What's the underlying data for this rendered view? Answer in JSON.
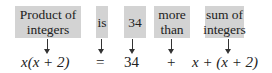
{
  "phrases": [
    {
      "line1": "Product of",
      "line2": "integers"
    },
    {
      "line1": "is",
      "line2": ""
    },
    {
      "line1": "34",
      "line2": ""
    },
    {
      "line1": "more",
      "line2": "than"
    },
    {
      "line1": "sum of",
      "line2": "integers"
    }
  ],
  "equation": {
    "term1": "x(x + 2)",
    "equals": "=",
    "value": "34",
    "plus": "+",
    "term2": "x + (x + 2)"
  },
  "colors": {
    "box_fill": "#d3d3d3",
    "text": "#222222"
  }
}
